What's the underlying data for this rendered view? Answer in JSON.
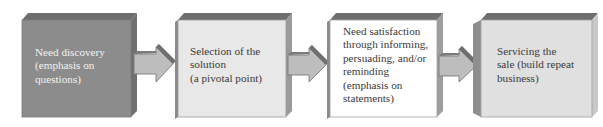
{
  "diagram": {
    "type": "process-flow",
    "direction": "left-to-right",
    "steps": [
      {
        "label": "Need discovery\n(emphasis on\nquestions)",
        "face_color": "#8c8c8c",
        "text_color": "#f2f2f2"
      },
      {
        "label": "Selection of the\nsolution\n(a pivotal point)",
        "face_color": "#e8e8e8",
        "text_color": "#3a3a3a"
      },
      {
        "label": "Need satisfaction\nthrough informing,\npersuading, and/or\nreminding\n(emphasis on\nstatements)",
        "face_color": "#ffffff",
        "text_color": "#3a3a3a"
      },
      {
        "label": "Servicing the\nsale (build repeat\nbusiness)",
        "face_color": "#e0e0e0",
        "text_color": "#3a3a3a"
      }
    ],
    "connectors": [
      {
        "from": 0,
        "to": 1,
        "icon": "right-arrow-icon"
      },
      {
        "from": 1,
        "to": 2,
        "icon": "right-arrow-icon"
      },
      {
        "from": 2,
        "to": 3,
        "icon": "right-arrow-icon"
      }
    ],
    "colors": {
      "bevel_dark": "#6a6a6a",
      "bevel_mid": "#9a9a9a",
      "arrow_fill": "#bdbdbd",
      "arrow_top": "#7a7a7a",
      "outline": "#8a8a8a"
    }
  }
}
